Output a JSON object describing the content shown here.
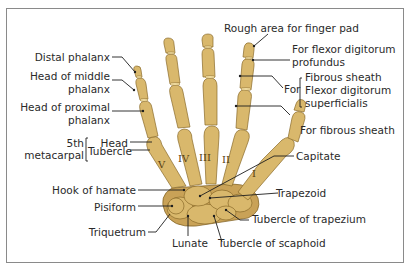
{
  "diagram": {
    "labels_left": {
      "distal_phalanx": "Distal phalanx",
      "head_middle_phalanx_1": "Head of middle",
      "head_middle_phalanx_2": "phalanx",
      "head_proximal_phalanx_1": "Head of proximal",
      "head_proximal_phalanx_2": "phalanx",
      "fifth_metacarpal_1": "5th",
      "fifth_metacarpal_2": "metacarpal",
      "head": "Head",
      "tubercle": "Tubercle",
      "hook_of_hamate": "Hook of hamate",
      "pisiform": "Pisiform",
      "triquetrum": "Triquetrum"
    },
    "labels_bottom": {
      "lunate": "Lunate",
      "tubercle_of_scaphoid": "Tubercle of scaphoid"
    },
    "labels_right": {
      "rough_area": "Rough area for finger pad",
      "flexor_profundus_1": "For flexor digitorum",
      "flexor_profundus_2": "profundus",
      "for": "For",
      "fibrous_sheath": "Fibrous sheath",
      "flexor_superficialis_1": "Flexor digitorum",
      "flexor_superficialis_2": "superficialis",
      "for_fibrous_sheath": "For fibrous sheath",
      "capitate": "Capitate",
      "trapezoid": "Trapezoid",
      "tubercle_of_trapezium": "Tubercle of trapezium"
    },
    "metacarpal_numerals": [
      "V",
      "IV",
      "III",
      "II",
      "I"
    ],
    "colors": {
      "bone": "#d9b86c",
      "bone_shadow": "#c9a257",
      "outline": "#8a6a2a",
      "leader_line": "#1e1e1e",
      "text": "#2a2a2a",
      "frame": "#8a8a8a"
    }
  }
}
